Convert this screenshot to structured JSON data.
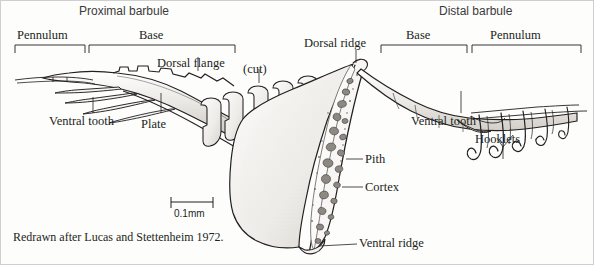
{
  "figure": {
    "title_left": "Proximal barbule",
    "title_right": "Distal barbule",
    "caption": "Redrawn after Lucas and Stettenheim 1972.",
    "scale_bar_label": "0.1mm",
    "ink_color": "#231f20",
    "fill_light": "#f2f1ee",
    "fill_mid": "#d8d6d1",
    "fill_dark": "#9a9691"
  },
  "brackets": {
    "left_pennulum": "Pennulum",
    "left_base": "Base",
    "right_base": "Base",
    "right_pennulum": "Pennulum"
  },
  "labels": {
    "dorsal_flange": "Dorsal flange",
    "cut": "(cut)",
    "dorsal_ridge": "Dorsal ridge",
    "ventral_tooth_left": "Ventral tooth",
    "plate": "Plate",
    "ventral_tooth_right": "Ventral tooth",
    "hooklets": "Hooklets",
    "pith": "Pith",
    "cortex": "Cortex",
    "ventral_ridge": "Ventral ridge"
  }
}
